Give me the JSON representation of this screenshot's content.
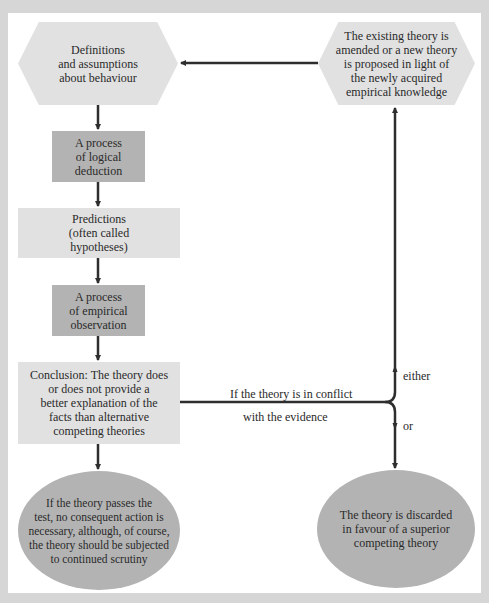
{
  "nodes": {
    "definitions": {
      "lines": [
        "Definitions",
        "and assumptions",
        "about behaviour"
      ]
    },
    "logical_deduction": {
      "lines": [
        "A process",
        "of logical",
        "deduction"
      ]
    },
    "predictions": {
      "lines": [
        "Predictions",
        "(often called",
        "hypotheses)"
      ]
    },
    "empirical_observation": {
      "lines": [
        "A process",
        "of empirical",
        "observation"
      ]
    },
    "conclusion": {
      "lines": [
        "Conclusion: The theory does",
        "or does not provide a",
        "better explanation of the",
        "facts than alternative",
        "competing theories"
      ]
    },
    "passes_test": {
      "lines": [
        "If the theory passes the",
        "test, no consequent action is",
        "necessary, although, of course,",
        "the theory should be subjected",
        "to continued scrutiny"
      ]
    },
    "amended": {
      "lines": [
        "The existing theory is",
        "amended or a new theory",
        "is proposed in light of",
        "the newly acquired",
        "empirical knowledge"
      ]
    },
    "discarded": {
      "lines": [
        "The theory is discarded",
        "in favour of a superior",
        "competing theory"
      ]
    }
  },
  "edge_labels": {
    "conflict_line1": "If the theory is in conflict",
    "conflict_line2": "with the evidence",
    "either": "either",
    "or": "or"
  },
  "colors": {
    "background": "#d6d6d6",
    "frame": "#ffffff",
    "light_fill": "#e1e1e1",
    "dark_fill": "#b3b3b3",
    "line": "#2e2e2e"
  }
}
